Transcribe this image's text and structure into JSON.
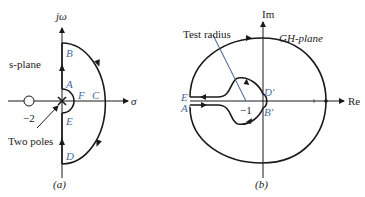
{
  "panel_a": {
    "caption": "(a)",
    "plane_label": "s-plane",
    "y_axis_label": "jω",
    "x_axis_label": "σ",
    "zero_label": "−2",
    "poles_label": "Two poles",
    "points": [
      "A",
      "B",
      "C",
      "D",
      "E",
      "F"
    ]
  },
  "panel_b": {
    "caption": "(b)",
    "plane_label": "GH-plane",
    "y_axis_label": "Im",
    "x_axis_label": "Re",
    "test_radius_label": "Test radius",
    "critical_point_label": "−1",
    "points": [
      "A′",
      "B′",
      "D′",
      "E′"
    ]
  },
  "colors": {
    "line": "#1a1a1a",
    "label_blue": "#4a6a9a",
    "test_radius": "#3a5a8a"
  }
}
